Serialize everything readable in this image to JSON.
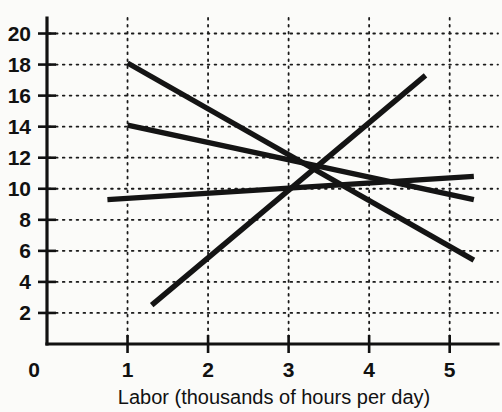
{
  "chart_data": {
    "type": "line",
    "title": "",
    "xlabel": "Labor (thousands of hours per day)",
    "ylabel": "",
    "xlim": [
      0,
      5.6
    ],
    "ylim": [
      0,
      21
    ],
    "grid": true,
    "grid_style": "dotted",
    "legend": "none",
    "x_ticks": [
      0,
      1,
      2,
      3,
      4,
      5
    ],
    "x_tick_labels": [
      "0",
      "1",
      "2",
      "3",
      "4",
      "5"
    ],
    "y_ticks": [
      2,
      4,
      6,
      8,
      10,
      12,
      14,
      16,
      18,
      20
    ],
    "y_tick_labels": [
      "2",
      "4",
      "6",
      "8",
      "10",
      "12",
      "14",
      "16",
      "18",
      "20"
    ],
    "series": [
      {
        "name": "demand-steep",
        "direction": "downward",
        "points": [
          [
            1.0,
            18.1
          ],
          [
            5.3,
            5.4
          ]
        ]
      },
      {
        "name": "demand-shallow",
        "direction": "downward",
        "points": [
          [
            1.0,
            14.1
          ],
          [
            5.3,
            9.3
          ]
        ]
      },
      {
        "name": "supply-shallow",
        "direction": "upward",
        "points": [
          [
            0.75,
            9.3
          ],
          [
            5.3,
            10.8
          ]
        ]
      },
      {
        "name": "supply-steep",
        "direction": "upward",
        "points": [
          [
            1.3,
            2.5
          ],
          [
            4.7,
            17.3
          ]
        ]
      }
    ],
    "intersections": [
      [
        2,
        12
      ],
      [
        3,
        14
      ],
      [
        4,
        8
      ],
      [
        5,
        10
      ]
    ]
  },
  "axis": {
    "origin_label": "0",
    "x_title": "Labor (thousands of hours per day)"
  }
}
